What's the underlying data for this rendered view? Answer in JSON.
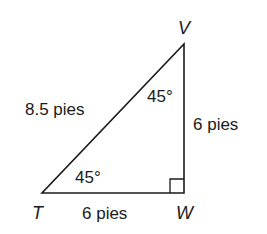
{
  "diagram": {
    "type": "right-triangle",
    "vertices": {
      "T": {
        "label": "T",
        "x": 42,
        "y": 193
      },
      "W": {
        "label": "W",
        "x": 184,
        "y": 193
      },
      "V": {
        "label": "V",
        "x": 184,
        "y": 44
      }
    },
    "sides": {
      "hypotenuse_TV": "8.5 pies",
      "vertical_WV": "6 pies",
      "base_TW": "6 pies"
    },
    "angles": {
      "at_V": "45°",
      "at_T": "45°",
      "at_W": "right-angle"
    },
    "stroke_color": "#1a1a1a"
  }
}
